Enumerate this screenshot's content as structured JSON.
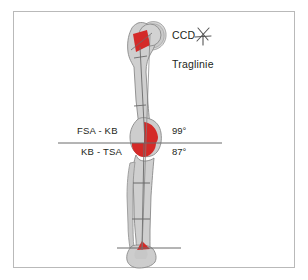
{
  "figure": {
    "frame_color": "#b9b9b9",
    "background_color": "#ffffff"
  },
  "annotations": {
    "ccd_label": "CCD",
    "ccd_symbol_name": "ccd-angle-symbol",
    "traglinie_label": "Traglinie",
    "femur_label": "FSA - KB",
    "tibia_label": "KB - TSA",
    "femur_angle": "99°",
    "tibia_angle": "87°"
  },
  "anatomy": {
    "bone_fill": "#cfcfcf",
    "bone_stroke": "#8a8a8a",
    "highlight_color": "#d42a28",
    "axis_line_color": "#6b6b6b",
    "reference_line_color": "#6b6b6b",
    "regions": [
      {
        "name": "femoral-head-neck-highlight",
        "color": "#d42a28"
      },
      {
        "name": "knee-joint-angle-wedge",
        "color": "#d42a28"
      },
      {
        "name": "ankle-joint-highlight",
        "color": "#d42a28"
      }
    ],
    "bones": [
      {
        "name": "femur"
      },
      {
        "name": "tibia"
      },
      {
        "name": "fibula"
      },
      {
        "name": "patella"
      },
      {
        "name": "talus-foot"
      },
      {
        "name": "pelvis-acetabulum"
      }
    ]
  },
  "reference_lines": [
    {
      "name": "knee-reference-line",
      "y": 143,
      "x1": 58,
      "x2": 222
    },
    {
      "name": "ankle-reference-line",
      "y": 248,
      "x1": 117,
      "x2": 181
    }
  ]
}
